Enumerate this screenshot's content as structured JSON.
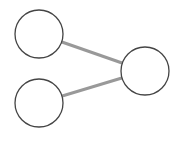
{
  "diagram": {
    "type": "graph",
    "background": "#ffffff",
    "node_style": {
      "fill": "#ffffff",
      "stroke": "#444444",
      "stroke_width": 1.3,
      "radius": 24
    },
    "edge_style": {
      "stroke": "#999999",
      "stroke_width": 3
    },
    "nodes": [
      {
        "id": "n1",
        "label": "",
        "cx": 39,
        "cy": 34
      },
      {
        "id": "n2",
        "label": "",
        "cx": 39,
        "cy": 103
      },
      {
        "id": "n3",
        "label": "",
        "cx": 145,
        "cy": 71
      }
    ],
    "edges": [
      {
        "source": "n1",
        "target": "n3"
      },
      {
        "source": "n2",
        "target": "n3"
      }
    ]
  }
}
